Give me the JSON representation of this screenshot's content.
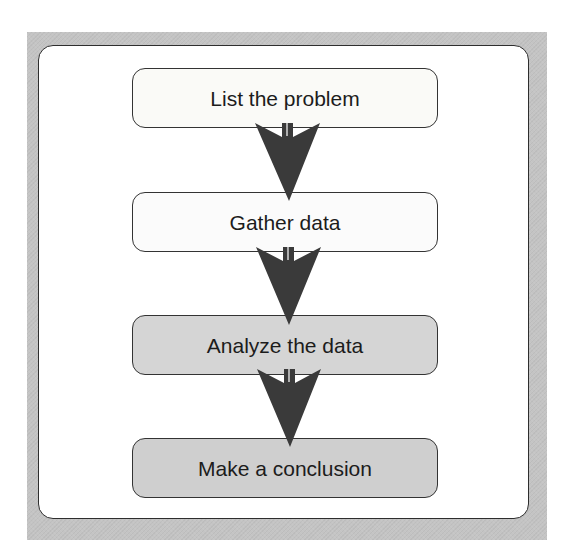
{
  "diagram": {
    "type": "flowchart",
    "direction": "top-to-bottom",
    "colors": {
      "frame": "#c4c4c4",
      "panel": "#ffffff",
      "border": "#333333",
      "arrow": "#3a3a3a",
      "text": "#1c1c1c"
    },
    "steps": [
      {
        "label": "List the problem",
        "fill": "#fafaf7",
        "top": 68
      },
      {
        "label": "Gather data",
        "fill": "#fbfbfb",
        "top": 192
      },
      {
        "label": "Analyze the data",
        "fill": "#d5d5d5",
        "top": 315
      },
      {
        "label": "Make a conclusion",
        "fill": "#cfcfcf",
        "top": 438
      }
    ],
    "arrows": [
      {
        "from": 0,
        "to": 1,
        "top": 123
      },
      {
        "from": 1,
        "to": 2,
        "top": 247
      },
      {
        "from": 2,
        "to": 3,
        "top": 369
      }
    ],
    "arrow_icon": "down-arrow-icon"
  }
}
